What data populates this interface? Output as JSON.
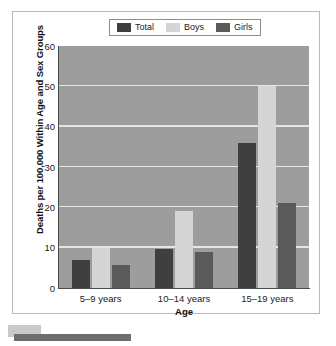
{
  "chart_data": {
    "type": "bar",
    "title": "",
    "xlabel": "Age",
    "ylabel": "Deaths per 100,000 Within Age and Sex Groups",
    "categories": [
      "5–9 years",
      "10–14 years",
      "15–19 years"
    ],
    "series": [
      {
        "name": "Total",
        "color": "#3f3f3f",
        "values": [
          7.0,
          9.7,
          36.0
        ]
      },
      {
        "name": "Boys",
        "color": "#d5d5d5",
        "values": [
          10.0,
          19.0,
          50.0
        ]
      },
      {
        "name": "Girls",
        "color": "#5a5a5a",
        "values": [
          5.6,
          9.0,
          21.0
        ]
      }
    ],
    "ylim": [
      0,
      60
    ],
    "yticks": [
      0,
      10,
      20,
      30,
      40,
      50,
      60
    ],
    "ytick_labels": [
      "0",
      "10",
      "20",
      "30",
      "40",
      "50",
      "60"
    ],
    "grid": true,
    "grid_color": "#e6e6e6",
    "plot_background": "#9d9d9d",
    "legend_position": "top-center"
  },
  "legend": {
    "items": [
      {
        "label": "Total",
        "color": "#3f3f3f"
      },
      {
        "label": "Boys",
        "color": "#d5d5d5"
      },
      {
        "label": "Girls",
        "color": "#5a5a5a"
      }
    ]
  },
  "axes": {
    "y_title": "Deaths per 100,000 Within Age and Sex Groups",
    "x_title": "Age"
  }
}
